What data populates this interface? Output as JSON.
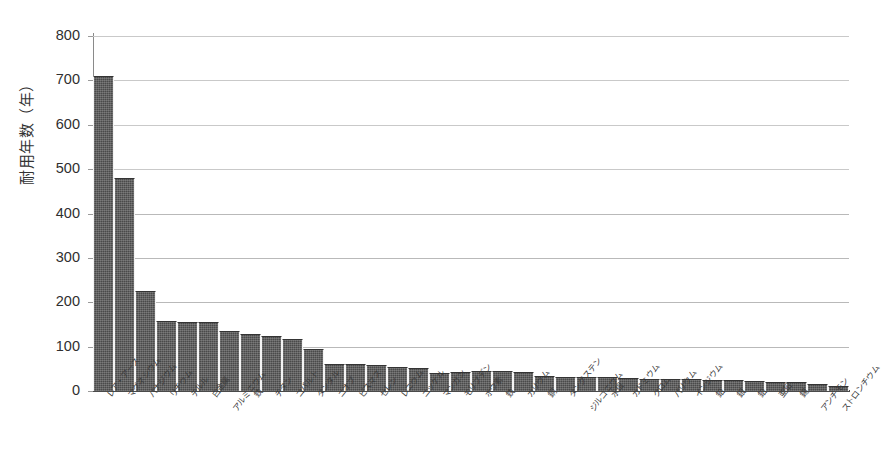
{
  "chart_data": {
    "type": "bar",
    "title": "",
    "subtitle": "",
    "xlabel": "",
    "ylabel": "耐用年数（年）",
    "ylim": [
      0,
      800
    ],
    "ytick_step": 100,
    "yticks": [
      800,
      700,
      600,
      500,
      400,
      300,
      200,
      100,
      0
    ],
    "grid": true,
    "grid_axis": "y",
    "legend": false,
    "legend_position": "none",
    "bar_color": "#4a4a4a",
    "sort_order": "descending",
    "categories": [
      "レア・アース",
      "マグネシウム",
      "バナジウム",
      "リチウム",
      "テルル",
      "白金属",
      "アルミニウム",
      "鉄",
      "チタン",
      "コバルト",
      "タンタル",
      "ニオブ",
      "ビスマス",
      "セレン",
      "レニウム",
      "ニッケル",
      "マンガン",
      "モリブデン",
      "ホウ素",
      "鉄",
      "カリウム",
      "銅",
      "タングステン",
      "ジルコニウム",
      "水銀",
      "カドミウム",
      "クロム",
      "バリウム",
      "インジウム",
      "鉛",
      "銀",
      "鉛",
      "亜鉛",
      "錫",
      "アンチモン",
      "ストロンチウム"
    ],
    "values": [
      710,
      480,
      225,
      158,
      155,
      155,
      135,
      128,
      125,
      118,
      95,
      62,
      60,
      58,
      55,
      52,
      40,
      42,
      44,
      44,
      42,
      34,
      32,
      32,
      32,
      30,
      28,
      27,
      26,
      25,
      24,
      22,
      21,
      20,
      16,
      12
    ],
    "units": "年"
  },
  "axis": {
    "y_title": "耐用年数（年）",
    "tick_labels": [
      "800",
      "700",
      "600",
      "500",
      "400",
      "300",
      "200",
      "100",
      "0"
    ]
  }
}
